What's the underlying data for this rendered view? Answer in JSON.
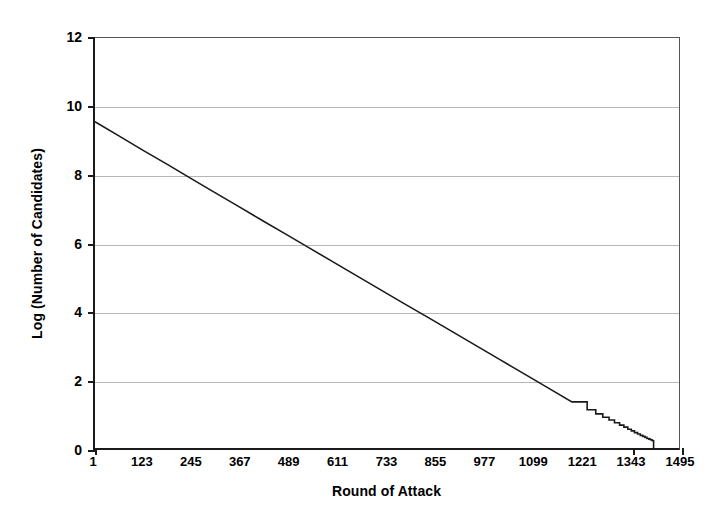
{
  "chart_data": {
    "type": "line",
    "title": "",
    "xlabel": "Round of Attack",
    "ylabel": "Log (Number of Candidates)",
    "xlim": [
      1,
      1495
    ],
    "ylim": [
      0,
      12
    ],
    "grid": true,
    "gridlines_y": [
      2,
      4,
      6,
      8,
      10
    ],
    "legend": "none",
    "x_tick_labels": [
      "1",
      "123",
      "245",
      "367",
      "489",
      "611",
      "733",
      "855",
      "977",
      "1099",
      "1221",
      "1343",
      "1495"
    ],
    "x_tick_values": [
      1,
      123,
      245,
      367,
      489,
      611,
      733,
      855,
      977,
      1099,
      1221,
      1343,
      1495
    ],
    "y_tick_labels": [
      "0",
      "2",
      "4",
      "6",
      "8",
      "10",
      "12"
    ],
    "y_tick_values": [
      0,
      2,
      4,
      6,
      8,
      10,
      12
    ],
    "series": [
      {
        "name": "Log (Number of Candidates)",
        "color": "#1a1a1a",
        "line_width": 1.6,
        "x": [
          1,
          60,
          123,
          186,
          245,
          310,
          367,
          430,
          489,
          550,
          611,
          672,
          733,
          794,
          855,
          916,
          977,
          1038,
          1099,
          1160,
          1221,
          1260,
          1282,
          1300,
          1316,
          1330,
          1343,
          1354,
          1364,
          1373,
          1381,
          1389,
          1396,
          1402,
          1408,
          1413,
          1418,
          1422,
          1426,
          1428,
          1430,
          1430
        ],
        "y": [
          9.55,
          9.15,
          8.72,
          8.3,
          7.9,
          7.46,
          7.08,
          6.65,
          6.26,
          5.85,
          5.44,
          5.03,
          4.62,
          4.21,
          3.81,
          3.4,
          2.99,
          2.58,
          2.17,
          1.76,
          1.35,
          1.12,
          1.0,
          0.9,
          0.82,
          0.74,
          0.67,
          0.61,
          0.55,
          0.5,
          0.45,
          0.41,
          0.37,
          0.34,
          0.31,
          0.28,
          0.26,
          0.24,
          0.22,
          0.21,
          0.2,
          0.0
        ],
        "note": "approximately linear decay from 9.55 at round 1 to 0 near round 1430, with integer-quantization staircase steps visible below y=1"
      }
    ]
  },
  "axes": {
    "y_title": "Log (Number of Candidates)",
    "x_title": "Round of Attack"
  }
}
